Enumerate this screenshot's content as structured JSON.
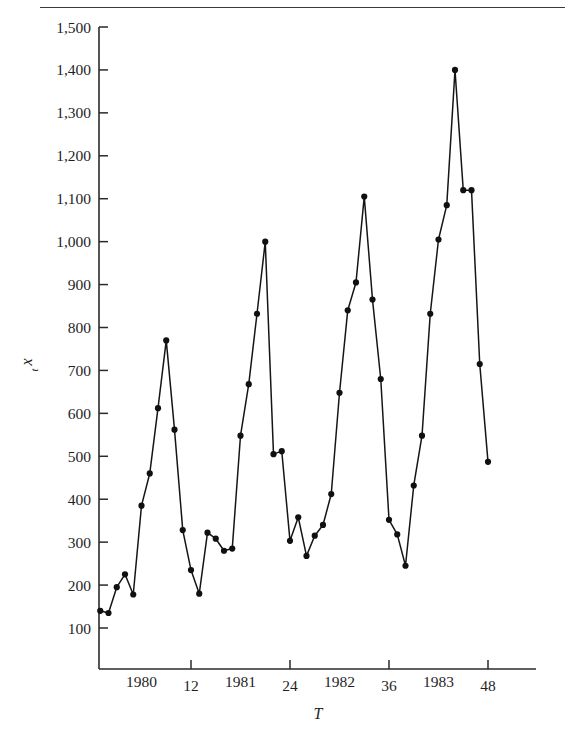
{
  "figure": {
    "has_top_rule": true,
    "background": "#ffffff",
    "ink_color": "#1a1a1a"
  },
  "chart_data": {
    "type": "line",
    "title": "",
    "subtitle": "",
    "xlabel": "T",
    "ylabel": "x_t",
    "ylabel_display": "x",
    "ylabel_sub": "t",
    "grid": false,
    "legend": null,
    "marker": "filled-circle",
    "xlim": [
      0,
      49
    ],
    "ylim": [
      0,
      1500
    ],
    "yticks": [
      100,
      200,
      300,
      400,
      500,
      600,
      700,
      800,
      900,
      1000,
      1100,
      1200,
      1300,
      1400,
      1500
    ],
    "ytick_labels": [
      "100",
      "200",
      "300",
      "400",
      "500",
      "600",
      "700",
      "800",
      "900",
      "1,000",
      "1,100",
      "1,200",
      "1,300",
      "1,400",
      "1,500"
    ],
    "xticks": [
      12,
      24,
      36,
      48
    ],
    "xtick_labels": [
      "12",
      "24",
      "36",
      "48"
    ],
    "x_year_labels": [
      {
        "label": "1980",
        "at": 6
      },
      {
        "label": "1981",
        "at": 18
      },
      {
        "label": "1982",
        "at": 30
      },
      {
        "label": "1983",
        "at": 42
      }
    ],
    "x": [
      1,
      2,
      3,
      4,
      5,
      6,
      7,
      8,
      9,
      10,
      11,
      12,
      13,
      14,
      15,
      16,
      17,
      18,
      19,
      20,
      21,
      22,
      23,
      24,
      25,
      26,
      27,
      28,
      29,
      30,
      31,
      32,
      33,
      34,
      35,
      36,
      37,
      38,
      39,
      40,
      41,
      42,
      43,
      44,
      45,
      46,
      47,
      48
    ],
    "values": [
      140,
      135,
      195,
      225,
      178,
      385,
      460,
      612,
      770,
      562,
      328,
      235,
      180,
      322,
      308,
      280,
      285,
      548,
      668,
      832,
      1000,
      505,
      512,
      303,
      358,
      268,
      315,
      340,
      412,
      648,
      840,
      905,
      1105,
      865,
      680,
      352,
      318,
      245,
      432,
      548,
      832,
      1005,
      1085,
      1400,
      1120,
      1120,
      715,
      487
    ]
  }
}
